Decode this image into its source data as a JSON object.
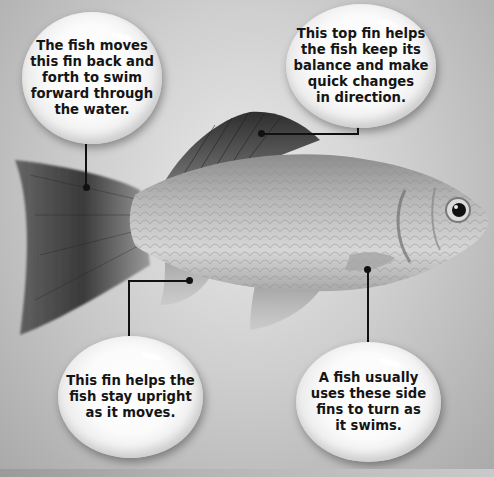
{
  "diagram": {
    "subject": "fish",
    "callouts": [
      {
        "id": "tail-fin",
        "text": "The fish moves\nthis fin back and\nforth to swim\nforward through\nthe water."
      },
      {
        "id": "dorsal-fin",
        "text": "This top fin helps\nthe fish keep its\nbalance and make\nquick changes\nin direction."
      },
      {
        "id": "anal-fin",
        "text": "This fin helps the\nfish stay upright\nas it moves."
      },
      {
        "id": "pectoral-fin",
        "text": "A fish usually\nuses these side\nfins to turn as\nit swims."
      }
    ]
  },
  "colors": {
    "background": "#cfcfcf",
    "bubble": "#ffffff",
    "text": "#151515",
    "connector": "#111111"
  }
}
